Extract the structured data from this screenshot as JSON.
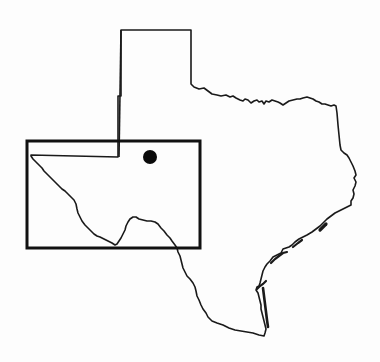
{
  "map": {
    "title": "Texas locator map",
    "region": "Texas",
    "colors": {
      "background": "#fdfdfd",
      "outline": "#1a1a1a",
      "inset_box": "#111111",
      "marker": "#0a0a0a"
    },
    "inset_box": {
      "label": "Study area (West Texas)",
      "x": 27,
      "y": 141,
      "width": 173,
      "height": 107
    },
    "marker": {
      "label": "Site location",
      "cx": 150,
      "cy": 157,
      "r": 7
    }
  }
}
